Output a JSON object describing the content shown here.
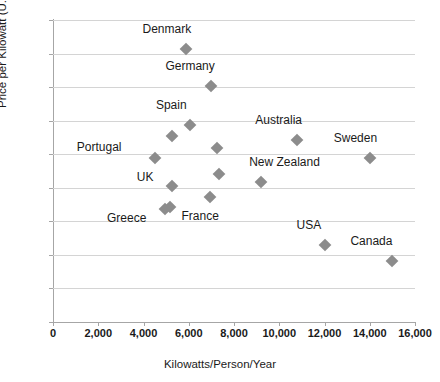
{
  "chart_data": {
    "type": "scatter",
    "title": "",
    "xlabel": "Kilowatts/Person/Year",
    "ylabel": "Price per Kilowatt (U.S. Dollars)",
    "xlim": [
      0,
      16000
    ],
    "ylim": [
      0,
      45
    ],
    "xticks": [
      "0",
      "2,000",
      "4,000",
      "6,000",
      "8,000",
      "10,000",
      "12,000",
      "14,000",
      "16,000"
    ],
    "xtick_values": [
      0,
      2000,
      4000,
      6000,
      8000,
      10000,
      12000,
      14000,
      16000
    ],
    "yticks": [
      "0",
      "5",
      "10",
      "15",
      "20",
      "25",
      "30",
      "35",
      "40",
      "45"
    ],
    "ytick_values": [
      0,
      5,
      10,
      15,
      20,
      25,
      30,
      35,
      40,
      45
    ],
    "grid": "horizontal",
    "legend": "none",
    "marker_color": "#8c8c8c",
    "marker_shape": "diamond",
    "points": [
      {
        "label": "Denmark",
        "x": 5900,
        "y": 40.7,
        "label_dx": -44,
        "label_dy": -20
      },
      {
        "label": "Germany",
        "x": 7000,
        "y": 35.1,
        "label_dx": -46,
        "label_dy": -20
      },
      {
        "label": "Spain",
        "x": 6050,
        "y": 29.4,
        "label_dx": -34,
        "label_dy": -20
      },
      {
        "label": "",
        "x": 5250,
        "y": 27.7,
        "label_dx": 0,
        "label_dy": 0
      },
      {
        "label": "Australia",
        "x": 10800,
        "y": 27.1,
        "label_dx": -42,
        "label_dy": -20
      },
      {
        "label": "",
        "x": 7250,
        "y": 26.0,
        "label_dx": 0,
        "label_dy": 0
      },
      {
        "label": "Portugal",
        "x": 4500,
        "y": 24.5,
        "label_dx": -78,
        "label_dy": -11
      },
      {
        "label": "Sweden",
        "x": 14000,
        "y": 24.5,
        "label_dx": -36,
        "label_dy": -20
      },
      {
        "label": "",
        "x": 7350,
        "y": 22.1,
        "label_dx": 0,
        "label_dy": 0
      },
      {
        "label": "New Zealand",
        "x": 9200,
        "y": 20.8,
        "label_dx": -12,
        "label_dy": -20
      },
      {
        "label": "UK",
        "x": 5250,
        "y": 20.3,
        "label_dx": -35,
        "label_dy": -9
      },
      {
        "label": "",
        "x": 6950,
        "y": 18.6,
        "label_dx": 0,
        "label_dy": 0
      },
      {
        "label": "France",
        "x": 5150,
        "y": 17.1,
        "label_dx": 12,
        "label_dy": 9
      },
      {
        "label": "Greece",
        "x": 4950,
        "y": 16.9,
        "label_dx": -58,
        "label_dy": 9
      },
      {
        "label": "USA",
        "x": 12000,
        "y": 11.5,
        "label_dx": -28,
        "label_dy": -20
      },
      {
        "label": "Canada",
        "x": 15000,
        "y": 9.1,
        "label_dx": -42,
        "label_dy": -20
      }
    ]
  }
}
